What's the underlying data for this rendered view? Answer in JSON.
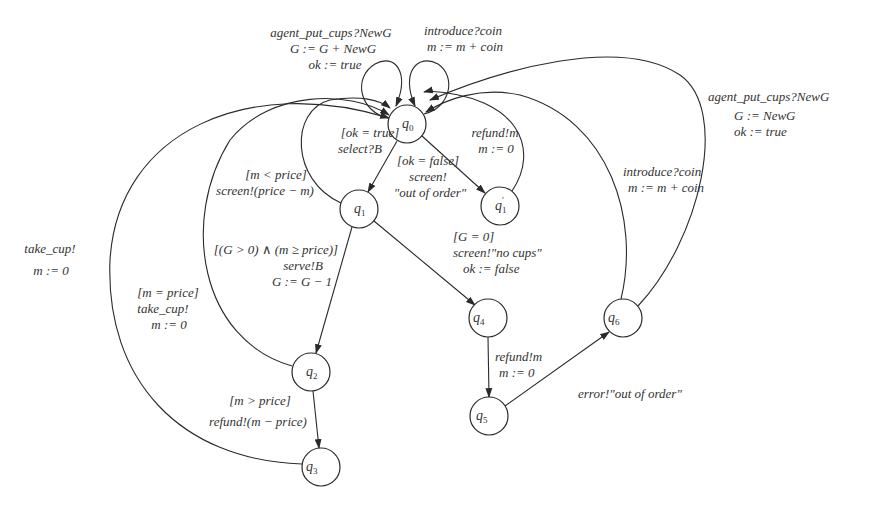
{
  "diagram": {
    "type": "state-machine",
    "title": "",
    "nodes": [
      {
        "id": "q0",
        "base": "q",
        "sub": "0",
        "prime": "",
        "x": 407,
        "y": 124
      },
      {
        "id": "q1",
        "base": "q",
        "sub": "1",
        "prime": "",
        "x": 359,
        "y": 209
      },
      {
        "id": "q1p",
        "base": "q",
        "sub": "1",
        "prime": "′",
        "x": 500,
        "y": 206
      },
      {
        "id": "q2",
        "base": "q",
        "sub": "2",
        "prime": "",
        "x": 311,
        "y": 372
      },
      {
        "id": "q3",
        "base": "q",
        "sub": "3",
        "prime": "",
        "x": 321,
        "y": 467
      },
      {
        "id": "q4",
        "base": "q",
        "sub": "4",
        "prime": "",
        "x": 488,
        "y": 318
      },
      {
        "id": "q5",
        "base": "q",
        "sub": "5",
        "prime": "",
        "x": 489,
        "y": 416
      },
      {
        "id": "q6",
        "base": "q",
        "sub": "6",
        "prime": "",
        "x": 623,
        "y": 318
      }
    ],
    "edges": [
      {
        "id": "q0-q0-put-cups",
        "from": "q0",
        "to": "q0",
        "lines": [
          "agent_put_cups?NewG",
          "G := G + NewG",
          "ok := true"
        ]
      },
      {
        "id": "q0-q0-coin",
        "from": "q0",
        "to": "q0",
        "lines": [
          "introduce?coin",
          "m := m + coin"
        ]
      },
      {
        "id": "q0-q1",
        "from": "q0",
        "to": "q1",
        "lines": [
          "[ok = true]",
          "select?B"
        ]
      },
      {
        "id": "q0-q1p",
        "from": "q0",
        "to": "q1p",
        "lines": [
          "[ok = false]",
          "screen!",
          "\"out of order\""
        ]
      },
      {
        "id": "q1p-q0",
        "from": "q1p",
        "to": "q0",
        "lines": [
          "refund!m",
          "m := 0"
        ]
      },
      {
        "id": "q1-q0",
        "from": "q1",
        "to": "q0",
        "lines": [
          "[m < price]",
          "screen!(price − m)"
        ]
      },
      {
        "id": "q1-q2",
        "from": "q1",
        "to": "q2",
        "lines": [
          "[(G > 0) ∧ (m ≥ price)]",
          "serve!B",
          "G := G − 1"
        ]
      },
      {
        "id": "q1-q4",
        "from": "q1",
        "to": "q4",
        "lines": [
          "[G = 0]",
          "screen!\"no cups\"",
          "ok := false"
        ]
      },
      {
        "id": "q2-q0",
        "from": "q2",
        "to": "q0",
        "lines": [
          "[m = price]",
          "take_cup!",
          "m := 0"
        ]
      },
      {
        "id": "q2-q3",
        "from": "q2",
        "to": "q3",
        "lines": [
          "[m > price]",
          "refund!(m − price)"
        ]
      },
      {
        "id": "q3-q0",
        "from": "q3",
        "to": "q0",
        "lines": [
          "take_cup!",
          "m := 0"
        ]
      },
      {
        "id": "q4-q5",
        "from": "q4",
        "to": "q5",
        "lines": [
          "refund!m",
          "m := 0"
        ]
      },
      {
        "id": "q5-q6",
        "from": "q5",
        "to": "q6",
        "lines": [
          "error!\"out of order\""
        ]
      },
      {
        "id": "q6-q0-coin",
        "from": "q6",
        "to": "q0",
        "lines": [
          "introduce?coin",
          "m := m + coin"
        ]
      },
      {
        "id": "q6-q0-put-cups",
        "from": "q6",
        "to": "q0",
        "lines": [
          "agent_put_cups?NewG",
          "G := NewG",
          "ok := true"
        ]
      }
    ]
  },
  "colors": {
    "stroke": "#2a2a2a",
    "text": "#333333",
    "background": "#ffffff"
  }
}
